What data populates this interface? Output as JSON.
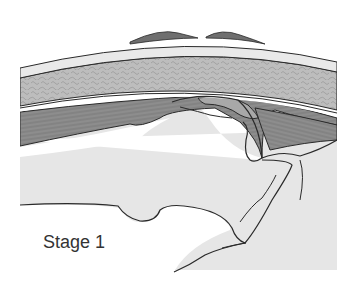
{
  "figure": {
    "caption": "Stage 1",
    "colors": {
      "background": "#ffffff",
      "bone_fill": "#e6e6e6",
      "skin_fill": "#e9e9e9",
      "dark_fat": "#6f6f6f",
      "cancellous_layer": "#b9b9b9",
      "muscle_fill": "#8a8a8a",
      "bursa_fill": "#a9a9a9",
      "outline": "#2a2a2a"
    }
  }
}
